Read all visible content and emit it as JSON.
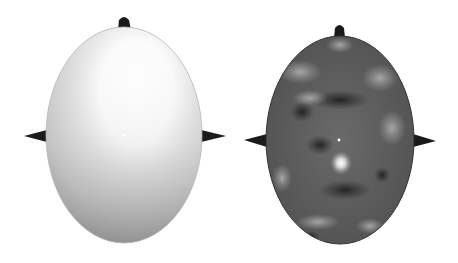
{
  "figure": {
    "title": "",
    "panels": [
      {
        "id": "left",
        "description": "Scalp topography map (smooth gradient, light top to darker bottom)",
        "shading": "smooth-gradient",
        "colors": {
          "light": "#ffffff",
          "mid": "#d2d2d2",
          "dark": "#8c8c8c"
        },
        "head": {
          "cx": 124,
          "cy": 135,
          "rx": 78,
          "ry": 108
        },
        "center_marker": {
          "x": 124,
          "y": 135
        }
      },
      {
        "id": "right",
        "description": "Scalp topography map (mottled dark pattern with bright spot below center)",
        "shading": "mottled",
        "colors": {
          "light": "#f0f0f0",
          "mid": "#6e6e6e",
          "dark": "#2e2e2e"
        },
        "head": {
          "cx": 340,
          "cy": 140,
          "rx": 74,
          "ry": 104
        },
        "center_marker": {
          "x": 339,
          "y": 140
        }
      }
    ],
    "feature_color": "#1a1a1a",
    "background": "#ffffff"
  }
}
